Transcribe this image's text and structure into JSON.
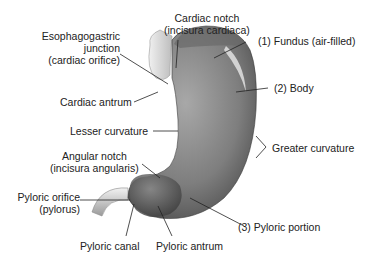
{
  "diagram": {
    "colors": {
      "stomach_dark": "#4a4a4a",
      "stomach_mid": "#8a8a8a",
      "stomach_light": "#c8c8c8",
      "esophagus": "#d8d8d8",
      "leader_line": "#222222"
    },
    "labels": {
      "cardiac_notch": {
        "line1": "Cardiac notch",
        "line2": "(incisura cardiaca)"
      },
      "esophagogastric": {
        "line1": "Esophagogastric",
        "line2": "junction",
        "line3": "(cardiac orifice)"
      },
      "fundus": "(1) Fundus (air-filled)",
      "body": "(2) Body",
      "cardiac_antrum": "Cardiac antrum",
      "lesser_curvature": "Lesser curvature",
      "greater_curvature": "Greater curvature",
      "angular_notch": {
        "line1": "Angular notch",
        "line2": "(incisura angularis)"
      },
      "pyloric_orifice": {
        "line1": "Pyloric orifice",
        "line2": "(pylorus)"
      },
      "pyloric_portion": "(3) Pyloric portion",
      "pyloric_canal": "Pyloric canal",
      "pyloric_antrum": "Pyloric antrum"
    }
  }
}
